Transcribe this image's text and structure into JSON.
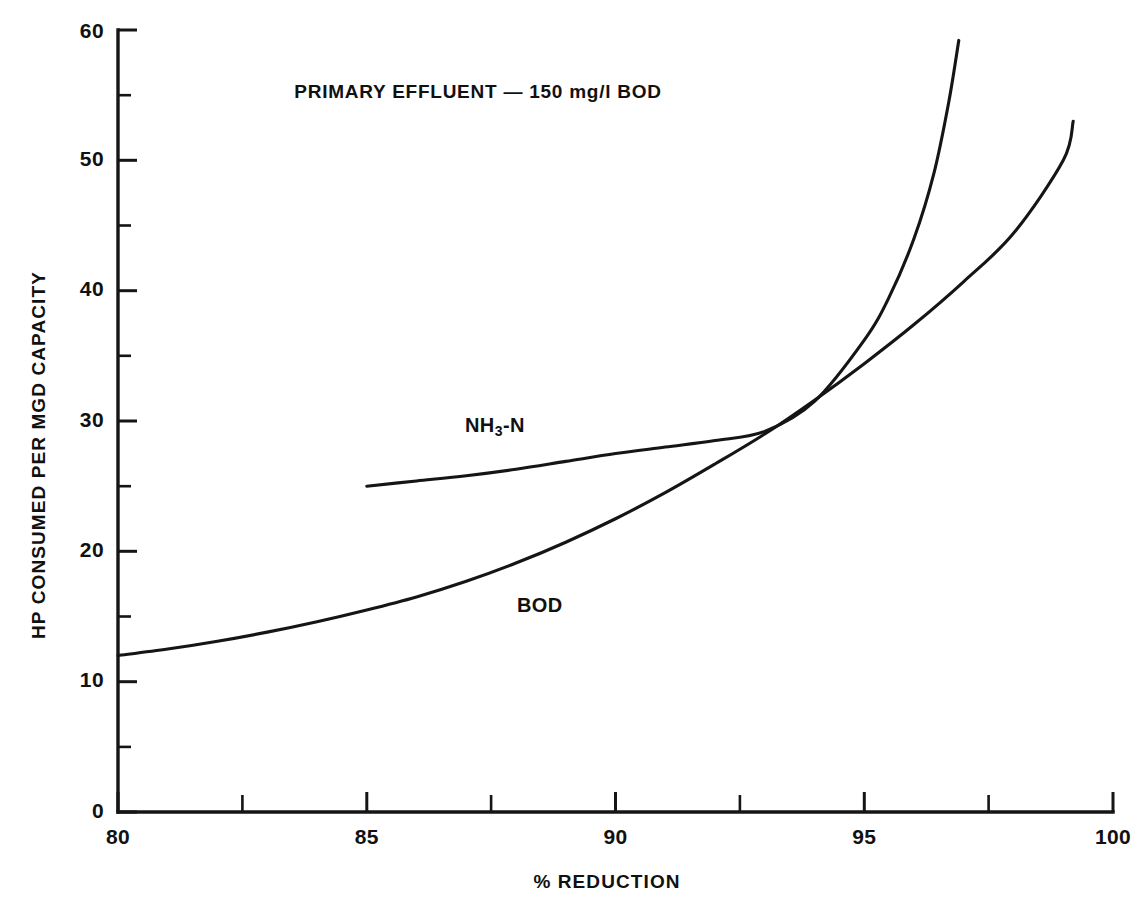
{
  "chart_data": {
    "type": "line",
    "title": "PRIMARY EFFLUENT — 150 mg/l BOD",
    "xlabel": "% REDUCTION",
    "ylabel": "HP CONSUMED PER MGD CAPACITY",
    "xlim": [
      80,
      100
    ],
    "ylim": [
      0,
      60
    ],
    "grid": false,
    "legend_position": "inline-annotations",
    "x_ticks_major": [
      80,
      85,
      90,
      95,
      100
    ],
    "x_tick_labels": [
      "80",
      "85",
      "90",
      "95",
      "100"
    ],
    "x_ticks_minor": [
      82.5,
      87.5,
      92.5,
      97.5
    ],
    "y_ticks_major": [
      0,
      10,
      20,
      30,
      40,
      50,
      60
    ],
    "y_tick_labels": [
      "0",
      "10",
      "20",
      "30",
      "40",
      "50",
      "60"
    ],
    "y_ticks_minor": [
      5,
      15,
      25,
      35,
      45,
      55
    ],
    "annotations": [
      {
        "text": "NH3-N",
        "x": 90.2,
        "y": 31.5
      },
      {
        "text": "BOD",
        "x": 91.6,
        "y": 17.2
      }
    ],
    "series": [
      {
        "name": "BOD",
        "label": "BOD",
        "color": "#151515",
        "x": [
          80,
          81,
          82,
          83,
          84,
          85,
          86,
          87,
          88,
          89,
          90,
          91,
          92,
          93,
          94,
          95,
          96,
          97,
          98,
          99,
          99.2
        ],
        "values": [
          12.0,
          12.5,
          13.1,
          13.8,
          14.6,
          15.5,
          16.5,
          17.7,
          19.1,
          20.7,
          22.5,
          24.5,
          26.7,
          29.0,
          31.6,
          34.4,
          37.4,
          40.7,
          44.4,
          50.0,
          53.0
        ]
      },
      {
        "name": "NH3-N",
        "label": "NH₃-N",
        "color": "#151515",
        "x": [
          85,
          86,
          87,
          88,
          89,
          90,
          91,
          92,
          93,
          94,
          95,
          95.5,
          96,
          96.4,
          96.7,
          96.9
        ],
        "values": [
          25.0,
          25.4,
          25.8,
          26.3,
          26.9,
          27.5,
          28.0,
          28.5,
          29.2,
          31.5,
          36.2,
          39.5,
          44.0,
          49.0,
          54.5,
          59.2
        ]
      }
    ]
  }
}
